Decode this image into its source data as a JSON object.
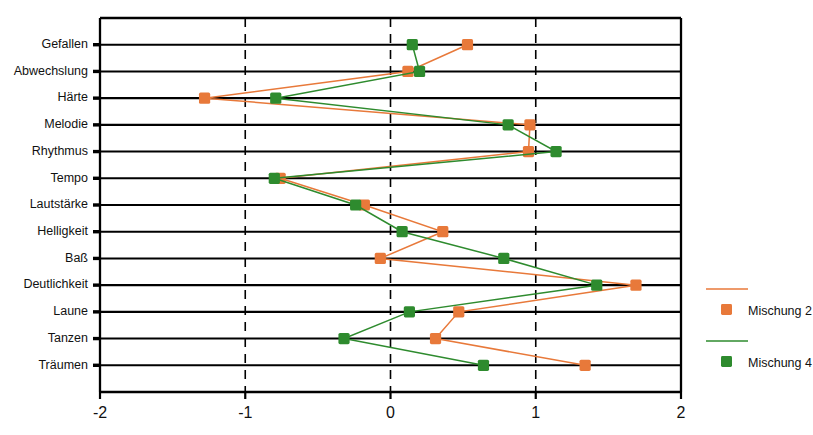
{
  "chart_data": {
    "type": "line",
    "orientation": "horizontal",
    "title": "",
    "xlabel": "",
    "ylabel": "",
    "xlim": [
      -2,
      2
    ],
    "xticks": [
      -2,
      -1,
      0,
      1,
      2
    ],
    "xtick_labels": [
      "-2",
      "-1",
      "0",
      "1",
      "2"
    ],
    "grid": "vertical-dashed",
    "legend_position": "right",
    "categories": [
      "Gefallen",
      "Abwechslung",
      "Härte",
      "Melodie",
      "Rhythmus",
      "Tempo",
      "Lautstärke",
      "Helligkeit",
      "Baß",
      "Deutlichkeit",
      "Laune",
      "Tanzen",
      "Träumen"
    ],
    "series": [
      {
        "name": "Mischung 2",
        "color": "#E8793A",
        "marker": "square",
        "values": [
          0.53,
          0.12,
          -1.28,
          0.96,
          0.95,
          -0.76,
          -0.18,
          0.36,
          -0.07,
          1.69,
          0.47,
          0.31,
          1.34
        ]
      },
      {
        "name": "Mischung 4",
        "color": "#2E8B2E",
        "marker": "square",
        "values": [
          0.15,
          0.2,
          -0.79,
          0.81,
          1.14,
          -0.8,
          -0.24,
          0.08,
          0.78,
          1.42,
          0.13,
          -0.32,
          0.64
        ]
      }
    ]
  },
  "legend": {
    "entries": [
      {
        "label": "Mischung 2",
        "color": "#E8793A"
      },
      {
        "label": "Mischung 4",
        "color": "#2E8B2E"
      }
    ]
  },
  "colors": {
    "series_orange": "#E8793A",
    "series_green": "#2E8B2E",
    "axis": "#000000",
    "background": "#FFFFFF"
  }
}
